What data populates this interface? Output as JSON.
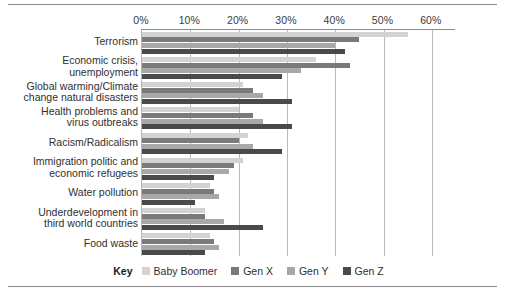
{
  "chart_data": {
    "type": "bar",
    "orientation": "horizontal",
    "title": "",
    "xlabel": "",
    "ylabel": "",
    "xlim": [
      0,
      65
    ],
    "xticks": [
      "0%",
      "10%",
      "20%",
      "30%",
      "40%",
      "50%",
      "60%"
    ],
    "xtick_values": [
      0,
      10,
      20,
      30,
      40,
      50,
      60
    ],
    "grid": true,
    "legend_position": "bottom",
    "legend_title": "Key",
    "categories": [
      "Terrorism",
      "Economic crisis,\nunemployment",
      "Global warming/Climate\nchange natural disasters",
      "Health problems and\nvirus outbreaks",
      "Racism/Radicalism",
      "Immigration politic and\neconomic refugees",
      "Water pollution",
      "Underdevelopment in\nthird world countries",
      "Food waste"
    ],
    "series": [
      {
        "name": "Baby Boomer",
        "color": "#d3d3d3",
        "values": [
          55,
          36,
          21,
          20,
          22,
          21,
          14,
          13,
          14
        ]
      },
      {
        "name": "Gen X",
        "color": "#7a7a7a",
        "values": [
          45,
          43,
          23,
          23,
          20,
          19,
          15,
          13,
          15
        ]
      },
      {
        "name": "Gen Y",
        "color": "#a8a8a8",
        "values": [
          40,
          33,
          25,
          25,
          23,
          18,
          16,
          17,
          16
        ]
      },
      {
        "name": "Gen Z",
        "color": "#4a4a4a",
        "values": [
          42,
          29,
          31,
          31,
          29,
          15,
          11,
          25,
          13
        ]
      }
    ]
  },
  "legend": {
    "key_label": "Key",
    "items": [
      {
        "label": "Baby Boomer",
        "color": "#d3d3d3"
      },
      {
        "label": "Gen X",
        "color": "#7a7a7a"
      },
      {
        "label": "Gen Y",
        "color": "#a8a8a8"
      },
      {
        "label": "Gen Z",
        "color": "#4a4a4a"
      }
    ]
  }
}
